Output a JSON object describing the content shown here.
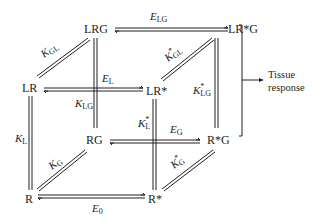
{
  "diagram": {
    "nodes": [
      {
        "id": "LRG",
        "label": "LRG",
        "x": 96,
        "y": 33
      },
      {
        "id": "LRsG",
        "label": "LR*G",
        "x": 243,
        "y": 33
      },
      {
        "id": "LR",
        "label": "LR",
        "x": 29,
        "y": 92
      },
      {
        "id": "LRs",
        "label": "LR*",
        "x": 153,
        "y": 95
      },
      {
        "id": "RG",
        "label": "RG",
        "x": 97,
        "y": 144
      },
      {
        "id": "RsG",
        "label": "R*G",
        "x": 216,
        "y": 144
      },
      {
        "id": "R",
        "label": "R",
        "x": 29,
        "y": 203
      },
      {
        "id": "Rs",
        "label": "R*",
        "x": 153,
        "y": 203
      }
    ],
    "edges": [
      {
        "from": "LRG",
        "to": "LRsG",
        "label": "E",
        "sub": "LG",
        "star": false
      },
      {
        "from": "LR",
        "to": "LRG",
        "label": "K",
        "sub": "GL",
        "star": false
      },
      {
        "from": "LRs",
        "to": "LRsG",
        "label": "K",
        "sub": "GL",
        "star": true
      },
      {
        "from": "LR",
        "to": "LRs",
        "label": "E",
        "sub": "L",
        "star": false
      },
      {
        "from": "LRG",
        "to": "RG",
        "label": "K",
        "sub": "LG",
        "star": false
      },
      {
        "from": "LRsG",
        "to": "RsG",
        "label": "K",
        "sub": "LG",
        "star": true
      },
      {
        "from": "LR",
        "to": "R",
        "label": "K",
        "sub": "L",
        "star": false
      },
      {
        "from": "LRs",
        "to": "Rs",
        "label": "K",
        "sub": "L",
        "star": true
      },
      {
        "from": "RG",
        "to": "RsG",
        "label": "E",
        "sub": "G",
        "star": false
      },
      {
        "from": "R",
        "to": "RG",
        "label": "K",
        "sub": "G",
        "star": false
      },
      {
        "from": "Rs",
        "to": "RsG",
        "label": "K",
        "sub": "G",
        "star": true
      },
      {
        "from": "R",
        "to": "Rs",
        "label": "E",
        "sub": "0",
        "star": false
      }
    ],
    "output": {
      "line1": "Tissue",
      "line2": "response"
    }
  }
}
